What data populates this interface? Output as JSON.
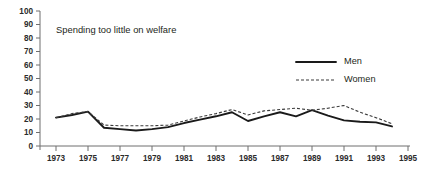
{
  "chart_data": {
    "type": "line",
    "title": "Spending too little on welfare",
    "xlabel": "",
    "ylabel": "",
    "ylim": [
      0,
      100
    ],
    "xlim": [
      1972,
      1995
    ],
    "ytick_step": 10,
    "yticks": [
      0,
      10,
      20,
      30,
      40,
      50,
      60,
      70,
      80,
      90,
      100
    ],
    "xticks": [
      1973,
      1975,
      1977,
      1979,
      1981,
      1983,
      1985,
      1987,
      1989,
      1991,
      1993,
      1995
    ],
    "grid": false,
    "legend_position": "upper-right",
    "x": [
      1973,
      1974,
      1975,
      1976,
      1977,
      1978,
      1979,
      1980,
      1981,
      1982,
      1983,
      1984,
      1985,
      1986,
      1987,
      1988,
      1989,
      1990,
      1991,
      1992,
      1993,
      1994
    ],
    "series": [
      {
        "name": "Men",
        "style": "solid",
        "color": "#1a1a1a",
        "values": [
          21,
          23,
          25.5,
          13.5,
          12.5,
          11.5,
          12.5,
          14,
          17,
          19.5,
          22,
          25,
          18.5,
          22,
          25,
          22,
          26.5,
          22.5,
          19,
          18,
          17.5,
          14.5
        ]
      },
      {
        "name": "Women",
        "style": "dashed",
        "color": "#3a3a3a",
        "values": [
          21,
          24,
          25.5,
          15.5,
          15,
          15,
          15,
          15.5,
          18.5,
          21.5,
          24,
          27,
          23,
          26,
          27,
          28,
          26.5,
          28,
          30,
          25,
          21,
          16.5
        ]
      }
    ]
  },
  "legend": {
    "items": [
      {
        "label": "Men"
      },
      {
        "label": "Women"
      }
    ]
  },
  "axis": {
    "y_labels": [
      "100",
      "90",
      "80",
      "70",
      "60",
      "50",
      "40",
      "30",
      "20",
      "10",
      "0"
    ],
    "x_labels": [
      "1973",
      "1975",
      "1977",
      "1979",
      "1981",
      "1983",
      "1985",
      "1987",
      "1989",
      "1991",
      "1993",
      "1995"
    ]
  }
}
